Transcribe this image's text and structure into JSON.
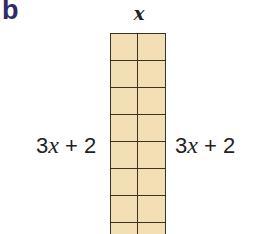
{
  "figure": {
    "part_label": "b",
    "part_label_color": "#2e2a6b",
    "top_label": "x",
    "left_label": {
      "coef": "3",
      "var": "x",
      "rest": " + 2"
    },
    "right_label": {
      "coef": "3",
      "var": "x",
      "rest": " + 2"
    },
    "grid": {
      "columns": 2,
      "rows_visible": 8,
      "fill_color": "#f3dfb4",
      "line_color": "#3a3128"
    }
  }
}
